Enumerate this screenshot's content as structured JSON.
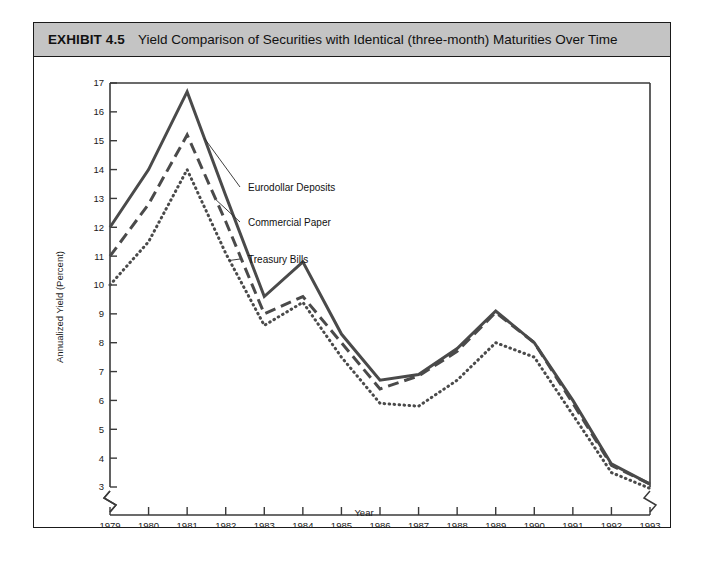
{
  "exhibit": {
    "number": "EXHIBIT 4.5",
    "title": "Yield Comparison of Securities with Identical (three-month) Maturities Over Time"
  },
  "chart_data": {
    "type": "line",
    "title": "Yield Comparison of Securities with Identical (three-month) Maturities Over Time",
    "xlabel": "Year",
    "ylabel": "Annualized Yield (Percent)",
    "xlim": [
      1979,
      1993
    ],
    "ylim": [
      3,
      17
    ],
    "y_axis_break_below": 3,
    "x_axis_break": true,
    "grid": false,
    "legend_position": "inline-annotations",
    "categories": [
      1979,
      1980,
      1981,
      1982,
      1983,
      1984,
      1985,
      1986,
      1987,
      1988,
      1989,
      1990,
      1991,
      1992,
      1993
    ],
    "xticklabels": [
      "1979",
      "1980",
      "1981",
      "1982",
      "1983",
      "1984",
      "1985",
      "1986",
      "1987",
      "1988",
      "1989",
      "1990",
      "1991",
      "1992",
      "1993"
    ],
    "yticklabels": [
      "3",
      "4",
      "5",
      "6",
      "7",
      "8",
      "9",
      "10",
      "11",
      "12",
      "13",
      "14",
      "15",
      "16",
      "17"
    ],
    "yticks": [
      3,
      4,
      5,
      6,
      7,
      8,
      9,
      10,
      11,
      12,
      13,
      14,
      15,
      16,
      17
    ],
    "series": [
      {
        "name": "Eurodollar Deposits",
        "style": "solid",
        "values": [
          12.0,
          14.0,
          16.7,
          13.1,
          9.6,
          10.8,
          8.3,
          6.7,
          6.9,
          7.8,
          9.1,
          8.0,
          6.0,
          3.8,
          3.1
        ]
      },
      {
        "name": "Commercial Paper",
        "style": "dashed",
        "values": [
          11.0,
          12.8,
          15.2,
          12.2,
          9.0,
          9.6,
          8.0,
          6.4,
          6.85,
          7.7,
          9.05,
          8.0,
          5.9,
          3.75,
          3.1
        ]
      },
      {
        "name": "Treasury Bills",
        "style": "dotted",
        "values": [
          10.0,
          11.5,
          14.0,
          11.1,
          8.6,
          9.4,
          7.5,
          5.9,
          5.8,
          6.7,
          8.0,
          7.5,
          5.5,
          3.5,
          2.95
        ]
      }
    ],
    "annotations": [
      {
        "label": "Eurodollar Deposits",
        "series": "Eurodollar Deposits"
      },
      {
        "label": "Commercial Paper",
        "series": "Commercial Paper"
      },
      {
        "label": "Treasury Bills",
        "series": "Treasury Bills"
      }
    ]
  }
}
